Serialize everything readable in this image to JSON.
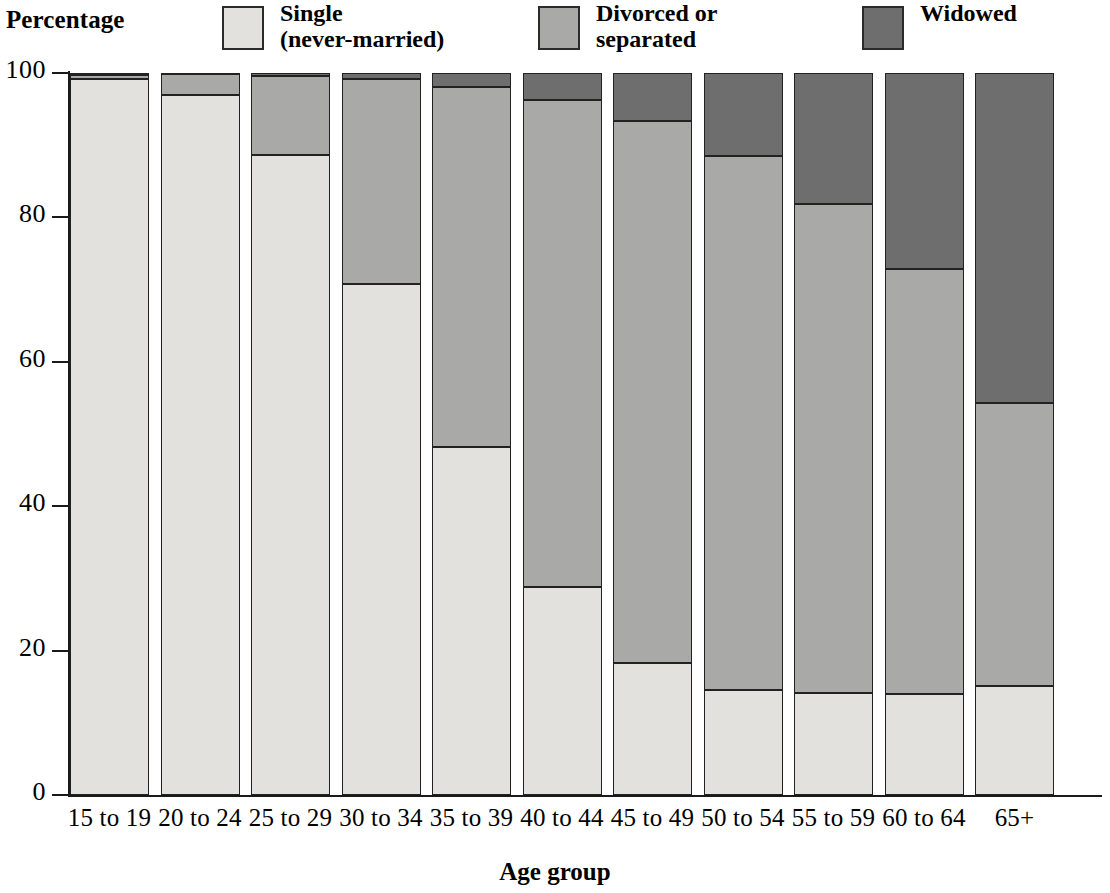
{
  "legend": {
    "axis_note": "Percentage",
    "entries": [
      {
        "label": "Single\n(never-married)",
        "key": "single",
        "color": "#e3e1dd"
      },
      {
        "label": "Divorced or\nseparated",
        "key": "divorced",
        "color": "#a9a9a7"
      },
      {
        "label": "Widowed",
        "key": "widowed",
        "color": "#6e6e6e"
      }
    ]
  },
  "axes": {
    "y_title": "Percentage",
    "x_title": "Age group",
    "y_ticks": [
      "100",
      "80",
      "60",
      "40",
      "20",
      "0"
    ]
  },
  "chart_data": {
    "type": "bar",
    "subtype": "stacked-100",
    "title": "",
    "xlabel": "Age group",
    "ylabel": "Percentage",
    "ylim": [
      0,
      100
    ],
    "yticks": [
      0,
      20,
      40,
      60,
      80,
      100
    ],
    "grid": false,
    "legend_position": "top",
    "categories": [
      "15 to 19",
      "20 to 24",
      "25 to 29",
      "30 to 34",
      "35 to 39",
      "40 to 44",
      "45 to 49",
      "50 to 54",
      "55 to 59",
      "60 to 64",
      "65+"
    ],
    "series": [
      {
        "name": "Single (never-married)",
        "color": "#e3e1dd",
        "values": [
          99.2,
          97.0,
          88.7,
          70.8,
          48.2,
          28.8,
          18.3,
          14.6,
          14.1,
          14.0,
          15.1
        ]
      },
      {
        "name": "Divorced or separated",
        "color": "#a9a9a7",
        "values": [
          0.5,
          2.8,
          10.9,
          28.4,
          49.9,
          67.4,
          75.1,
          73.9,
          67.7,
          58.8,
          39.2
        ]
      },
      {
        "name": "Widowed",
        "color": "#6e6e6e",
        "values": [
          0.3,
          0.2,
          0.4,
          0.8,
          1.9,
          3.8,
          6.6,
          11.5,
          18.2,
          27.2,
          45.7
        ]
      }
    ],
    "cumulative_tops": {
      "single": [
        99.2,
        97.0,
        88.7,
        70.8,
        48.2,
        28.8,
        18.3,
        14.6,
        14.1,
        14.0,
        15.1
      ],
      "divorced": [
        99.7,
        99.8,
        99.6,
        99.2,
        98.1,
        96.2,
        93.4,
        88.5,
        81.8,
        72.8,
        54.3
      ],
      "widowed": [
        100,
        100,
        100,
        100,
        100,
        100,
        100,
        100,
        100,
        100,
        100
      ]
    }
  }
}
